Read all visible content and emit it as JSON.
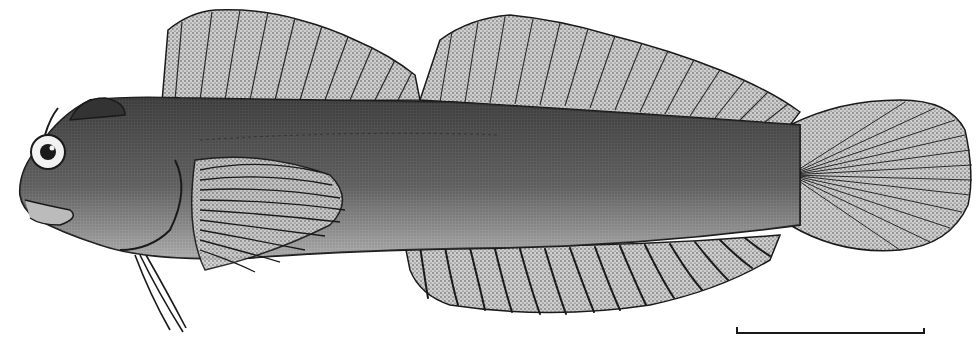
{
  "figure": {
    "style": "stipple drawing",
    "colors": {
      "background": "#ffffff",
      "ink": "#1a1a1a",
      "body_dark": "#3a3a3a",
      "body_mid": "#6e6e6e",
      "belly_light": "#d6d6d6",
      "fin_fill": "#bdbdbd"
    },
    "scale_bar": {
      "label": ""
    }
  }
}
